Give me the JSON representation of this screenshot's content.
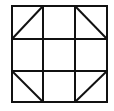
{
  "diagram": {
    "type": "quilt-block-grid",
    "rows": 3,
    "cols": 3,
    "stroke_color": "#111111",
    "background": "#ffffff",
    "frame": {
      "x1": 12,
      "y1": 6,
      "x2": 107,
      "y2": 102
    },
    "vertical_lines": [
      43,
      75
    ],
    "horizontal_lines": [
      39,
      71
    ],
    "diagonals": [
      {
        "cell": "top-left",
        "x1": 12,
        "y1": 39,
        "x2": 43,
        "y2": 6
      },
      {
        "cell": "top-right",
        "x1": 75,
        "y1": 6,
        "x2": 107,
        "y2": 39
      },
      {
        "cell": "bottom-left",
        "x1": 12,
        "y1": 71,
        "x2": 43,
        "y2": 102
      },
      {
        "cell": "bottom-right",
        "x1": 75,
        "y1": 102,
        "x2": 107,
        "y2": 71
      }
    ]
  }
}
